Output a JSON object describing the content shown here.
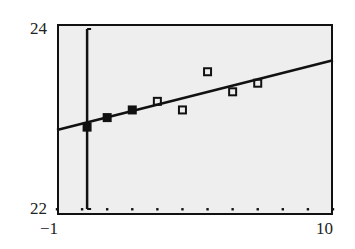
{
  "chart_data": {
    "type": "scatter",
    "title": "",
    "xlabel": "",
    "ylabel": "",
    "xlim": [
      -1,
      10
    ],
    "ylim": [
      22,
      24
    ],
    "x_tick_labels": [
      "-1",
      "10"
    ],
    "y_tick_labels": [
      "22",
      "24"
    ],
    "grid": false,
    "series": [
      {
        "name": "data",
        "marker": "square",
        "x": [
          0,
          1,
          2,
          3,
          4,
          5,
          6,
          7
        ],
        "y": [
          22.92,
          23.02,
          23.1,
          23.19,
          23.1,
          23.5,
          23.29,
          23.38
        ]
      },
      {
        "name": "regression line",
        "type": "line",
        "x": [
          -1,
          10
        ],
        "y": [
          22.89,
          23.62
        ]
      }
    ],
    "trace_cursor_x": 0.2,
    "axis_dots_y": 22.06
  },
  "labels": {
    "ymax": "24",
    "ymin": "22",
    "xmin": "−1",
    "xmax": "10"
  },
  "colors": {
    "plot_bg": "#eeeeee",
    "ink": "#111111"
  }
}
